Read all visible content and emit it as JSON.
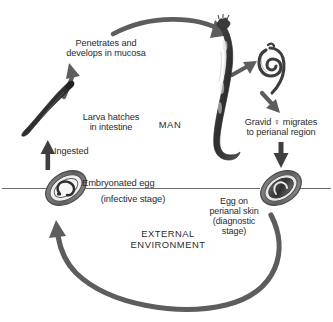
{
  "diagram": {
    "colors": {
      "text": "#2b2b2b",
      "arrow": "#5a5a5a",
      "line": "#6e6e6e",
      "organism_dark": "#3a3a3a",
      "organism_mid": "#707070",
      "background": "#ffffff"
    },
    "labels": {
      "penetrates": "Penetrates and\ndevelops in mucosa",
      "larva_hatches": "Larva hatches\nin intestine",
      "man": "MAN",
      "ingested": "Ingested",
      "gravid": "Gravid ♀ migrates\nto perianal region",
      "embryonated_egg": "Embryonated egg",
      "infective_stage": "(infective stage)",
      "egg_perianal": "Egg on\nperianal skin\n(diagnostic\nstage)",
      "external_environment": "EXTERNAL\nENVIRONMENT"
    },
    "organisms": [
      {
        "name": "larva",
        "description": "hatched larva in intestine"
      },
      {
        "name": "adult-worm",
        "description": "adult worm in mucosa"
      },
      {
        "name": "gravid-female",
        "description": "coiled gravid female worm"
      },
      {
        "name": "embryonated-egg",
        "description": "embryonated egg, infective stage"
      },
      {
        "name": "perianal-egg",
        "description": "egg on perianal skin, diagnostic stage"
      }
    ],
    "arrows": [
      {
        "name": "arrow-larva-to-mucosa",
        "from": "larva",
        "to": "adult-worm"
      },
      {
        "name": "arrow-top-curve",
        "from": "mucosa",
        "to": "adult-worm"
      },
      {
        "name": "arrow-ingested",
        "from": "embryonated-egg",
        "to": "larva"
      },
      {
        "name": "arrow-adult-to-gravid",
        "from": "adult-worm",
        "to": "gravid-female"
      },
      {
        "name": "arrow-gravid-down",
        "from": "gravid-female",
        "to": "perianal-region"
      },
      {
        "name": "arrow-to-perianal-egg",
        "from": "perianal-region",
        "to": "perianal-egg"
      },
      {
        "name": "arrow-bottom-curve",
        "from": "perianal-egg",
        "to": "embryonated-egg"
      }
    ],
    "divider": {
      "name": "host-environment-divider"
    }
  }
}
